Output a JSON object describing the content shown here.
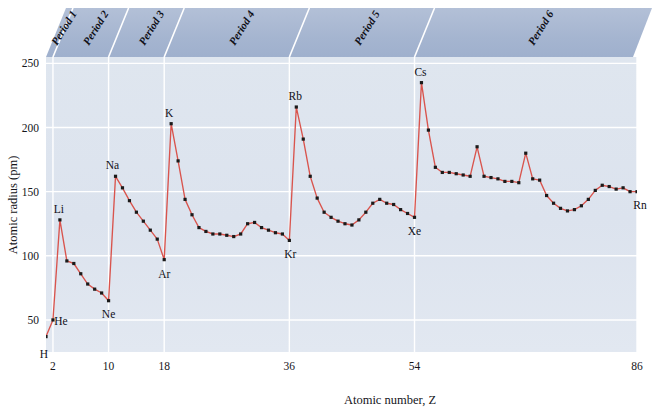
{
  "chart_data": {
    "type": "line",
    "title": "",
    "xlabel": "Atomic number, Z",
    "ylabel": "Atomic radius (pm)",
    "xlim": [
      1,
      86
    ],
    "ylim": [
      25,
      255
    ],
    "xticks": [
      2,
      10,
      18,
      36,
      54,
      86
    ],
    "yticks": [
      50,
      100,
      150,
      200,
      250
    ],
    "grid": true,
    "legend": "none",
    "line_color": "#d9544d",
    "marker_color": "#1a1a1a",
    "plot_bg": "#dde4ee",
    "band_color": "#a7b6d1",
    "gridline_color": "#ffffff",
    "series": [
      {
        "name": "Atomic radius",
        "x": [
          1,
          2,
          3,
          4,
          5,
          6,
          7,
          8,
          9,
          10,
          11,
          12,
          13,
          14,
          15,
          16,
          17,
          18,
          19,
          20,
          21,
          22,
          23,
          24,
          25,
          26,
          27,
          28,
          29,
          30,
          31,
          32,
          33,
          34,
          35,
          36,
          37,
          38,
          39,
          40,
          41,
          42,
          43,
          44,
          45,
          46,
          47,
          48,
          49,
          50,
          51,
          52,
          53,
          54,
          55,
          56,
          57,
          58,
          59,
          60,
          61,
          62,
          63,
          64,
          65,
          66,
          67,
          68,
          69,
          70,
          71,
          72,
          73,
          74,
          75,
          76,
          77,
          78,
          79,
          80,
          81,
          82,
          83,
          84,
          85,
          86
        ],
        "values": [
          37,
          50,
          128,
          96,
          94,
          86,
          78,
          74,
          71,
          65,
          162,
          153,
          143,
          134,
          127,
          120,
          113,
          97,
          203,
          174,
          144,
          132,
          122,
          119,
          117,
          117,
          116,
          115,
          117,
          125,
          126,
          122,
          120,
          118,
          117,
          112,
          216,
          191,
          162,
          145,
          134,
          130,
          127,
          125,
          124,
          128,
          134,
          141,
          144,
          141,
          140,
          136,
          133,
          130,
          235,
          198,
          169,
          165,
          165,
          164,
          163,
          162,
          185,
          162,
          161,
          160,
          158,
          158,
          157,
          180,
          160,
          159,
          147,
          141,
          137,
          135,
          136,
          139,
          144,
          151,
          155,
          154,
          152,
          153,
          150,
          150
        ]
      }
    ],
    "annotations": [
      {
        "label": "H",
        "x": 1,
        "y": 37,
        "dx": -2,
        "dy": 21
      },
      {
        "label": "He",
        "x": 2,
        "y": 50,
        "dx": 8,
        "dy": 5
      },
      {
        "label": "Li",
        "x": 3,
        "y": 128,
        "dx": -1,
        "dy": -7
      },
      {
        "label": "Ne",
        "x": 10,
        "y": 65,
        "dx": 0,
        "dy": 17
      },
      {
        "label": "Na",
        "x": 11,
        "y": 162,
        "dx": -3,
        "dy": -7
      },
      {
        "label": "Ar",
        "x": 18,
        "y": 97,
        "dx": 0,
        "dy": 18
      },
      {
        "label": "K",
        "x": 19,
        "y": 203,
        "dx": -2,
        "dy": -7
      },
      {
        "label": "Kr",
        "x": 36,
        "y": 112,
        "dx": 1,
        "dy": 18
      },
      {
        "label": "Rb",
        "x": 37,
        "y": 216,
        "dx": -1,
        "dy": -7
      },
      {
        "label": "Xe",
        "x": 54,
        "y": 130,
        "dx": 0,
        "dy": 18
      },
      {
        "label": "Cs",
        "x": 55,
        "y": 235,
        "dx": -1,
        "dy": -7
      },
      {
        "label": "Rn",
        "x": 86,
        "y": 150,
        "dx": 3,
        "dy": 17
      }
    ],
    "period_bands": [
      {
        "label": "Period 1",
        "x_start": 1,
        "x_end": 2
      },
      {
        "label": "Period 2",
        "x_start": 2,
        "x_end": 10
      },
      {
        "label": "Period 3",
        "x_start": 10,
        "x_end": 18
      },
      {
        "label": "Period 4",
        "x_start": 18,
        "x_end": 36
      },
      {
        "label": "Period 5",
        "x_start": 36,
        "x_end": 54
      },
      {
        "label": "Period 6",
        "x_start": 54,
        "x_end": 86
      }
    ]
  }
}
